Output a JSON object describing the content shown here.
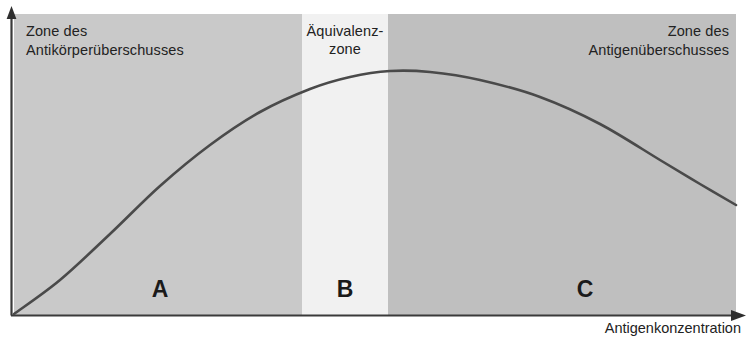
{
  "figure": {
    "type": "precipitation-curve-diagram",
    "background_color": "#ffffff",
    "panel": {
      "x": 14,
      "y": 14,
      "width": 722,
      "height": 301
    }
  },
  "axes": {
    "x_axis_label": "Antigenkonzentration",
    "y_axis_label": "",
    "x_arrow_icon": "arrow-right-icon",
    "y_arrow_icon": "arrow-up-icon",
    "axis_color": "#3a3a3a"
  },
  "zones": [
    {
      "key": "A",
      "letter": "A",
      "label": "Zone des\nAntikörperüberschusses",
      "color": "#c9c9c9",
      "x_start": 14,
      "x_end": 302
    },
    {
      "key": "B",
      "letter": "B",
      "label": "Äquivalenz-\nzone",
      "color": "#f1f1f1",
      "x_start": 302,
      "x_end": 388
    },
    {
      "key": "C",
      "letter": "C",
      "label": "Zone des\nAntigenüberschusses",
      "color": "#bfbfbf",
      "x_start": 388,
      "x_end": 736
    }
  ],
  "chart_data": {
    "type": "line",
    "title": "",
    "xlabel": "Antigenkonzentration",
    "ylabel": "",
    "grid": false,
    "legend": null,
    "curve_color": "#4a4a4a",
    "curve_width": 2.6,
    "series": [
      {
        "name": "Präzipitat",
        "points": [
          [
            14,
            314
          ],
          [
            60,
            280
          ],
          [
            110,
            234
          ],
          [
            160,
            186
          ],
          [
            210,
            145
          ],
          [
            260,
            112
          ],
          [
            310,
            89
          ],
          [
            350,
            77
          ],
          [
            390,
            71
          ],
          [
            430,
            72
          ],
          [
            480,
            80
          ],
          [
            540,
            97
          ],
          [
            600,
            124
          ],
          [
            660,
            160
          ],
          [
            700,
            184
          ],
          [
            736,
            205
          ]
        ]
      }
    ],
    "annotations": [
      {
        "text": "A",
        "x": 160,
        "y": 290
      },
      {
        "text": "B",
        "x": 345,
        "y": 290
      },
      {
        "text": "C",
        "x": 585,
        "y": 290
      },
      {
        "text": "Zone des Antikörperüberschusses",
        "x": 26,
        "y": 26
      },
      {
        "text": "Äquivalenz-zone",
        "x": 345,
        "y": 26
      },
      {
        "text": "Zone des Antigenüberschusses",
        "x": 718,
        "y": 26
      }
    ],
    "xlim": [
      14,
      747
    ],
    "ylim": [
      315,
      14
    ]
  }
}
